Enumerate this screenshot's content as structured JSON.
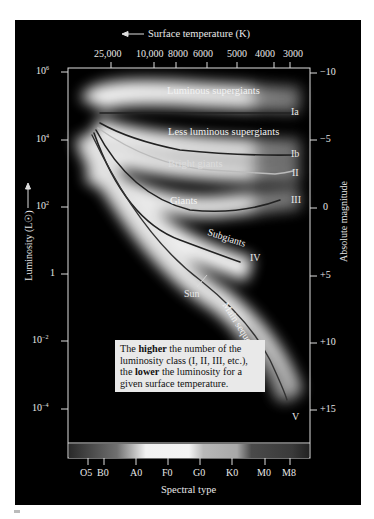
{
  "figure": {
    "top_axis_title": "Surface temperature (K)",
    "top_axis_arrow": "left-arrow",
    "top_ticks": [
      "25,000",
      "10,000",
      "8000",
      "6000",
      "5000",
      "4000",
      "3000"
    ],
    "left_axis_title": "Luminosity (L☉)",
    "left_axis_arrow": "up-arrow",
    "left_ticks": [
      {
        "base": "10",
        "exp": "6"
      },
      {
        "base": "10",
        "exp": "4"
      },
      {
        "base": "10",
        "exp": "2"
      },
      {
        "base": "1",
        "exp": ""
      },
      {
        "base": "10",
        "exp": "−2"
      },
      {
        "base": "10",
        "exp": "−4"
      }
    ],
    "right_axis_title": "Absolute magnitude",
    "right_ticks": [
      "−10",
      "−5",
      "0",
      "+5",
      "+10",
      "+15"
    ],
    "bottom_axis_title": "Spectral type",
    "bottom_ticks": [
      "O5",
      "B0",
      "A0",
      "F0",
      "G0",
      "K0",
      "M0",
      "M8"
    ],
    "region_labels": {
      "luminous_supergiants": "Luminous supergiants",
      "less_luminous_supergiants": "Less luminous supergiants",
      "bright_giants": "Bright giants",
      "giants": "Giants",
      "subgiants": "Subgiants",
      "main_sequence": "Main sequence",
      "sun": "Sun"
    },
    "class_labels": [
      "Ia",
      "Ib",
      "II",
      "III",
      "IV",
      "V"
    ],
    "note": {
      "part1": "The ",
      "bold1": "higher",
      "part2": " the number of the luminosity class (I, II, III, etc.), the ",
      "bold2": "lower",
      "part3": " the luminosity for a given surface temperature."
    }
  }
}
